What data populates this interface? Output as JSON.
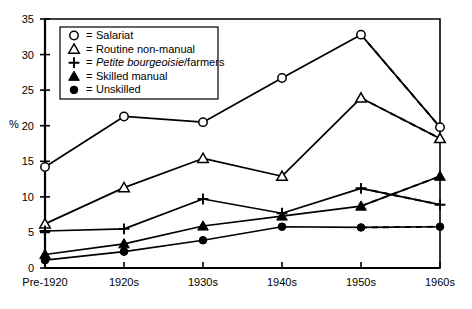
{
  "chart_data": {
    "type": "line",
    "title": "",
    "xlabel": "",
    "ylabel": "%",
    "categories": [
      "Pre-1920",
      "1920s",
      "1930s",
      "1940s",
      "1950s",
      "1960s"
    ],
    "ylim": [
      0,
      35
    ],
    "yticks": [
      0,
      5,
      10,
      15,
      20,
      25,
      30,
      35
    ],
    "grid": false,
    "legend_position": "top-left inside plot",
    "dashed_segment_note": "Final segment from 1950s to 1960s is drawn dashed for every series",
    "series": [
      {
        "name": "Salariat",
        "marker": "open-circle",
        "values": [
          14.2,
          21.3,
          20.5,
          26.7,
          32.8,
          19.8
        ]
      },
      {
        "name": "Routine non-manual",
        "marker": "open-triangle",
        "values": [
          6.2,
          11.3,
          15.4,
          12.9,
          23.9,
          18.2
        ]
      },
      {
        "name": "Petite bourgeoisie/farmers",
        "marker": "plus",
        "values": [
          5.2,
          5.5,
          9.7,
          7.7,
          11.2,
          8.9
        ]
      },
      {
        "name": "Skilled manual",
        "marker": "filled-triangle",
        "values": [
          1.9,
          3.4,
          5.9,
          7.3,
          8.7,
          12.9
        ]
      },
      {
        "name": "Unskilled",
        "marker": "filled-circle",
        "values": [
          1.1,
          2.3,
          3.9,
          5.8,
          5.7,
          5.8
        ]
      }
    ]
  },
  "legend": {
    "items": [
      {
        "marker": "open-circle",
        "equals": "=",
        "label": "Salariat",
        "label_italic": "",
        "label_tail": ""
      },
      {
        "marker": "open-triangle",
        "equals": "=",
        "label": "Routine non-manual",
        "label_italic": "",
        "label_tail": ""
      },
      {
        "marker": "plus",
        "equals": "=",
        "label": "",
        "label_italic": "Petite bourgeoisie",
        "label_tail": "/farmers"
      },
      {
        "marker": "filled-triangle",
        "equals": "=",
        "label": "Skilled manual",
        "label_italic": "",
        "label_tail": ""
      },
      {
        "marker": "filled-circle",
        "equals": "=",
        "label": "Unskilled",
        "label_italic": "",
        "label_tail": ""
      }
    ]
  },
  "colors": {
    "ink": "#000000",
    "background": "#ffffff"
  }
}
